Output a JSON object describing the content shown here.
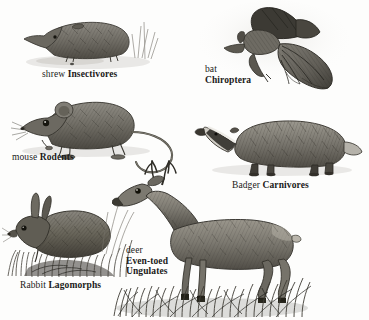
{
  "plate": {
    "title": "Mammal orders illustration plate",
    "background_color": "#fdfdfc",
    "ink_color": "#4a4842",
    "text_color": "#1a1a18",
    "width": 369,
    "height": 320,
    "style": "pencil / engraving line drawings"
  },
  "figures": [
    {
      "key": "shrew",
      "animal": "shrew",
      "icon": "shrew-illustration",
      "common_name": "shrew",
      "order_name": "Insectivores",
      "label_lines": [
        "shrew Insectivores"
      ],
      "label_layout": "inline",
      "position": {
        "x": 18,
        "y": 8,
        "w": 140,
        "h": 60
      },
      "label_position": {
        "x": 42,
        "y": 69
      }
    },
    {
      "key": "bat",
      "animal": "bat",
      "icon": "bat-illustration",
      "common_name": "bat",
      "order_name": "Chiroptera",
      "label_lines": [
        "bat",
        "Chiroptera"
      ],
      "label_layout": "stacked",
      "position": {
        "x": 196,
        "y": 4,
        "w": 150,
        "h": 92
      },
      "label_position": {
        "x": 205,
        "y": 64
      }
    },
    {
      "key": "mouse",
      "animal": "mouse",
      "icon": "mouse-illustration",
      "common_name": "mouse",
      "order_name": "Rodents",
      "label_lines": [
        "mouse Rodents"
      ],
      "label_layout": "inline",
      "position": {
        "x": 12,
        "y": 92,
        "w": 160,
        "h": 85
      },
      "label_position": {
        "x": 12,
        "y": 152
      }
    },
    {
      "key": "badger",
      "animal": "badger",
      "icon": "badger-illustration",
      "common_name": "Badger",
      "order_name": "Carnivores",
      "label_lines": [
        "Badger Carnivores"
      ],
      "label_layout": "inline",
      "position": {
        "x": 198,
        "y": 112,
        "w": 160,
        "h": 72
      },
      "label_position": {
        "x": 232,
        "y": 180
      }
    },
    {
      "key": "rabbit",
      "animal": "rabbit",
      "icon": "rabbit-illustration",
      "common_name": "Rabbit",
      "order_name": "Lagomorphs",
      "label_lines": [
        "Rabbit Lagomorphs"
      ],
      "label_layout": "inline",
      "position": {
        "x": 4,
        "y": 196,
        "w": 130,
        "h": 80
      },
      "label_position": {
        "x": 20,
        "y": 280
      }
    },
    {
      "key": "deer",
      "animal": "deer",
      "icon": "deer-illustration",
      "common_name": "deer",
      "order_name": "Even-toed Ungulates",
      "label_lines": [
        "deer",
        "Even-toed",
        "Ungulates"
      ],
      "label_layout": "stacked",
      "position": {
        "x": 118,
        "y": 164,
        "w": 160,
        "h": 150
      },
      "label_position": {
        "x": 126,
        "y": 245
      }
    }
  ]
}
